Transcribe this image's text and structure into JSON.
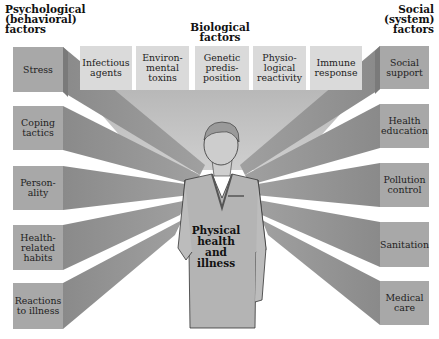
{
  "headers": {
    "psychological": "Psychological\n(behavioral)\nfactors",
    "biological": "Biological\nfactors",
    "social": "Social\n(system)\nfactors"
  },
  "psychological_factors": [
    {
      "label": "Stress"
    },
    {
      "label": "Coping\ntactics"
    },
    {
      "label": "Person-\nality"
    },
    {
      "label": "Health-\nrelated\nhabits"
    },
    {
      "label": "Reactions\nto illness"
    }
  ],
  "biological_factors": [
    {
      "label": "Infectious\nagents"
    },
    {
      "label": "Environ-\nmental\ntoxins"
    },
    {
      "label": "Genetic\npredis-\nposition"
    },
    {
      "label": "Physio-\nlogical\nreactivity"
    },
    {
      "label": "Immune\nresponse"
    }
  ],
  "social_factors": [
    {
      "label": "Social\nsupport"
    },
    {
      "label": "Health\neducation"
    },
    {
      "label": "Pollution\ncontrol"
    },
    {
      "label": "Sanitation"
    },
    {
      "label": "Medical\ncare"
    }
  ],
  "center": {
    "label": "Physical\nhealth\nand\nillness",
    "figure": "nurse-figure"
  },
  "colors": {
    "side_box": "#a8a8a8",
    "top_box": "#dadada",
    "beam_dark": "#8c8c8c",
    "beam_light": "#c4c4c4",
    "figure_fill": "#b4b4b4"
  }
}
